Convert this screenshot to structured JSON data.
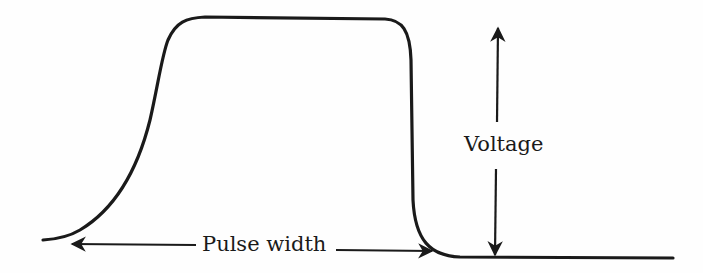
{
  "diagram": {
    "title": "",
    "type": "pulse waveform",
    "labels": {
      "pulse_width": "Pulse width",
      "voltage": "Voltage"
    },
    "colors": {
      "stroke": "#1a1a1a",
      "background": "#fefefe"
    },
    "elements": [
      {
        "id": "pulse-curve",
        "description": "Rectangular-ish voltage pulse: slow S-shaped rise on the left, flat top, sharp fall on the right, returning to baseline"
      },
      {
        "id": "pulse-width-arrow",
        "description": "Horizontal double-headed arrow along the bottom spanning the pulse, labeled 'Pulse width'"
      },
      {
        "id": "voltage-arrow",
        "description": "Vertical double-headed arrow to the right of the pulse spanning baseline to top, labeled 'Voltage'"
      }
    ]
  }
}
